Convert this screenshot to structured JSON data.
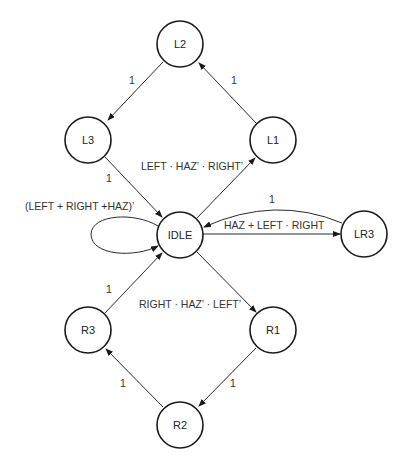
{
  "diagram": {
    "type": "state-machine",
    "nodes": [
      {
        "id": "L2",
        "label": "L2",
        "x": 180,
        "y": 44
      },
      {
        "id": "L3",
        "label": "L3",
        "x": 88,
        "y": 140
      },
      {
        "id": "L1",
        "label": "L1",
        "x": 273,
        "y": 140
      },
      {
        "id": "IDLE",
        "label": "IDLE",
        "x": 180,
        "y": 235
      },
      {
        "id": "LR3",
        "label": "LR3",
        "x": 364,
        "y": 234
      },
      {
        "id": "R3",
        "label": "R3",
        "x": 88,
        "y": 330
      },
      {
        "id": "R1",
        "label": "R1",
        "x": 273,
        "y": 330
      },
      {
        "id": "R2",
        "label": "R2",
        "x": 180,
        "y": 425
      }
    ],
    "edges": [
      {
        "from": "IDLE",
        "to": "L1",
        "label": "LEFT · HAZ’ · RIGHT’"
      },
      {
        "from": "L1",
        "to": "L2",
        "label": "1"
      },
      {
        "from": "L2",
        "to": "L3",
        "label": "1"
      },
      {
        "from": "L3",
        "to": "IDLE",
        "label": "1"
      },
      {
        "from": "IDLE",
        "to": "IDLE",
        "label": "(LEFT + RIGHT +HAZ)’"
      },
      {
        "from": "IDLE",
        "to": "LR3",
        "label": "HAZ + LEFT · RIGHT"
      },
      {
        "from": "LR3",
        "to": "IDLE",
        "label": "1"
      },
      {
        "from": "IDLE",
        "to": "R1",
        "label": "RIGHT · HAZ’ · LEFT’"
      },
      {
        "from": "R1",
        "to": "R2",
        "label": "1"
      },
      {
        "from": "R2",
        "to": "R3",
        "label": "1"
      },
      {
        "from": "R3",
        "to": "IDLE",
        "label": "1"
      }
    ]
  },
  "colors": {
    "stroke": "#1a1a1a",
    "text": "#333333",
    "background": "#ffffff"
  }
}
